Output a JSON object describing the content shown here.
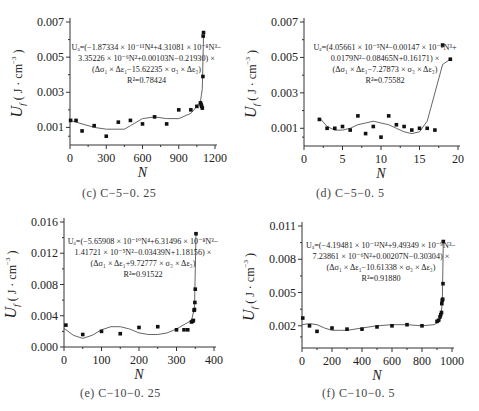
{
  "figure": {
    "y_label_main": "U",
    "y_label_sub": "f",
    "y_label_units": "( J · cm",
    "y_label_exp": "−3",
    "y_label_close": ")",
    "x_label": "N"
  },
  "panels": [
    {
      "id": "c",
      "caption": "(c) C−5−0. 25",
      "equation": [
        "Uₐ=(−1.87334 × 10⁻¹¹N⁴+4.31081 × 10⁻⁸N³−",
        "3.35226 × 10⁻⁶N²+0.00103N−0.21930) ×",
        "(Δσ₁ × Δε₁−15.62235 × σ₃ × Δε₃)",
        "R²=0.78424"
      ]
    },
    {
      "id": "d",
      "caption": "(d) C−5−0. 5",
      "equation": [
        "Uₐ=(4.05661 × 10⁻⁵N⁴−0.00147 × 10⁻⁸N³+",
        "0.0179N²−0.08465N+0.16171) ×",
        "(Δσ₁ × Δε₁−7.27873 × σ₃ × Δε₃)",
        "R²=0.75582"
      ]
    },
    {
      "id": "e",
      "caption": "(e) C−10−0. 25",
      "equation": [
        "Uₐ=(−5.65908 × 10⁻¹⁰N⁴+6.31496 × 10⁻⁸N³−",
        "1.41721 × 10⁻⁵N²−0.03439N+1.18156) ×",
        "(Δσ₁ × Δε₁+9.72777 × σ₃ × Δε₃)",
        "R²=0.91522"
      ]
    },
    {
      "id": "f",
      "caption": "(f) C−10−0. 5",
      "equation": [
        "Uₐ=(−4.19481 × 10⁻¹²N⁴+9.49349 × 10⁻⁹N³−",
        "7.23861 × 10⁻⁶N²+0.00207N−0.30304) ×",
        "(Δσ₁ × Δε₁−10.61338 × σ₃ × Δε₃)",
        "R²=0.91880"
      ]
    }
  ],
  "chart_data": [
    {
      "type": "scatter",
      "title": "(c) C-5-0.25",
      "xlabel": "N",
      "ylabel": "U_f (J·cm^-3)",
      "xlim": [
        0,
        1200
      ],
      "ylim": [
        0,
        0.007
      ],
      "xticks": [
        0,
        300,
        600,
        900,
        1200
      ],
      "yticks": [
        0.001,
        0.003,
        0.005,
        0.007
      ],
      "ytick_labels": [
        "0.001",
        "0.003",
        "0.005",
        "0.007"
      ],
      "series": [
        {
          "name": "measured",
          "x": [
            5,
            50,
            100,
            200,
            300,
            400,
            500,
            600,
            700,
            800,
            900,
            1000,
            1050,
            1080,
            1085,
            1090,
            1095,
            1100,
            1102,
            1105
          ],
          "y": [
            0.0014,
            0.0014,
            0.0008,
            0.0011,
            0.0005,
            0.0013,
            0.0014,
            0.0012,
            0.0016,
            0.0012,
            0.002,
            0.002,
            0.0022,
            0.0024,
            0.0023,
            0.0022,
            0.0021,
            0.0039,
            0.0062,
            0.0064
          ]
        },
        {
          "name": "fit",
          "x": [
            0,
            100,
            200,
            300,
            400,
            450,
            500,
            600,
            700,
            800,
            900,
            1000,
            1050,
            1080,
            1095,
            1105
          ],
          "y": [
            0.0014,
            0.0012,
            0.001,
            0.0009,
            0.0009,
            0.0009,
            0.0011,
            0.0015,
            0.0016,
            0.0015,
            0.0015,
            0.0018,
            0.0022,
            0.0025,
            0.0032,
            0.0062
          ]
        }
      ],
      "annotation": "U_f=(-1.87334×10^-11 N^4+4.31081×10^-8 N^3-3.35226×10^-6 N^2+0.00103N-0.21930)×(Δσ1×Δε1-15.62235×σ3×Δε3), R²=0.78424"
    },
    {
      "type": "scatter",
      "title": "(d) C-5-0.5",
      "xlabel": "N",
      "ylabel": "U_f (J·cm^-3)",
      "xlim": [
        0,
        20
      ],
      "ylim": [
        0,
        0.007
      ],
      "xticks": [
        0,
        5,
        10,
        15,
        20
      ],
      "yticks": [
        0.001,
        0.003,
        0.005,
        0.007
      ],
      "ytick_labels": [
        "0.001",
        "0.003",
        "0.005",
        "0.007"
      ],
      "series": [
        {
          "name": "measured",
          "x": [
            2,
            3,
            4,
            5,
            6,
            7,
            8,
            9,
            10,
            11,
            12,
            13,
            14,
            15,
            16,
            17,
            18,
            19
          ],
          "y": [
            0.0015,
            0.001,
            0.001,
            0.0011,
            0.0009,
            0.0017,
            0.0007,
            0.0011,
            0.0005,
            0.0017,
            0.0012,
            0.0011,
            0.0009,
            0.001,
            0.001,
            0.0009,
            0.0057,
            0.0049
          ]
        },
        {
          "name": "fit",
          "x": [
            2,
            3,
            4,
            5,
            6,
            7,
            8,
            9,
            10,
            11,
            12,
            13,
            14,
            15,
            16,
            17,
            18,
            19
          ],
          "y": [
            0.0016,
            0.0011,
            0.0009,
            0.0009,
            0.001,
            0.0012,
            0.0013,
            0.0014,
            0.0013,
            0.0012,
            0.001,
            0.0008,
            0.0007,
            0.0008,
            0.0014,
            0.003,
            0.0046,
            0.0049
          ]
        }
      ],
      "annotation": "U_f=(4.05661×10^-5 N^4-0.00147×10^-8 N^3+0.0179N^2-0.08465N+0.16171)×(Δσ1×Δε1-7.27873×σ3×Δε3), R²=0.75582"
    },
    {
      "type": "scatter",
      "title": "(e) C-10-0.25",
      "xlabel": "N",
      "ylabel": "U_f (J·cm^-3)",
      "xlim": [
        0,
        400
      ],
      "ylim": [
        0,
        0.016
      ],
      "xticks": [
        0,
        100,
        200,
        300,
        400
      ],
      "yticks": [
        0.0,
        0.004,
        0.008,
        0.012,
        0.016
      ],
      "ytick_labels": [
        "0.000",
        "0.004",
        "0.008",
        "0.012",
        "0.016"
      ],
      "series": [
        {
          "name": "measured",
          "x": [
            5,
            50,
            100,
            150,
            200,
            250,
            300,
            320,
            330,
            340,
            343,
            345,
            347,
            348,
            349,
            350,
            352
          ],
          "y": [
            0.0028,
            0.0016,
            0.002,
            0.0017,
            0.0025,
            0.0026,
            0.0022,
            0.0022,
            0.0022,
            0.0032,
            0.0033,
            0.0034,
            0.0047,
            0.0048,
            0.0057,
            0.0074,
            0.0145
          ]
        },
        {
          "name": "fit",
          "x": [
            0,
            25,
            50,
            75,
            100,
            125,
            150,
            175,
            200,
            225,
            250,
            275,
            300,
            325,
            340,
            348,
            352
          ],
          "y": [
            0.0024,
            0.0015,
            0.0011,
            0.0015,
            0.0022,
            0.0026,
            0.0026,
            0.0023,
            0.0018,
            0.0016,
            0.0016,
            0.0018,
            0.0023,
            0.003,
            0.0034,
            0.005,
            0.0145
          ]
        }
      ],
      "annotation": "U_f=(-5.65908×10^-10 N^4+6.31496×10^-8 N^3-1.41721×10^-5 N^2-0.03439N+1.18156)×(Δσ1×Δε1+9.72777×σ3×Δε3), R²=0.91522"
    },
    {
      "type": "scatter",
      "title": "(f) C-10-0.5",
      "xlabel": "N",
      "ylabel": "U_f (J·cm^-3)",
      "xlim": [
        0,
        1000
      ],
      "ylim": [
        0,
        0.011
      ],
      "xticks": [
        0,
        200,
        400,
        600,
        800,
        1000
      ],
      "yticks": [
        0.002,
        0.005,
        0.008,
        0.011
      ],
      "ytick_labels": [
        "0.002",
        "0.005",
        "0.008",
        "0.011"
      ],
      "series": [
        {
          "name": "measured",
          "x": [
            5,
            50,
            100,
            200,
            300,
            400,
            500,
            600,
            700,
            800,
            900,
            910,
            920,
            925,
            930,
            932,
            935,
            938,
            940,
            942
          ],
          "y": [
            0.0027,
            0.002,
            0.0015,
            0.0018,
            0.0017,
            0.0017,
            0.0019,
            0.002,
            0.0021,
            0.002,
            0.0024,
            0.0025,
            0.0028,
            0.003,
            0.0032,
            0.004,
            0.0043,
            0.0044,
            0.0058,
            0.0096
          ]
        },
        {
          "name": "fit",
          "x": [
            0,
            50,
            100,
            150,
            200,
            250,
            300,
            400,
            500,
            600,
            700,
            800,
            880,
            920,
            935,
            942
          ],
          "y": [
            0.0021,
            0.0022,
            0.0021,
            0.0018,
            0.0016,
            0.0016,
            0.0016,
            0.0018,
            0.002,
            0.0021,
            0.0021,
            0.002,
            0.0021,
            0.0024,
            0.004,
            0.0096
          ]
        }
      ],
      "annotation": "U_f=(-4.19481×10^-12 N^4+9.49349×10^-9 N^3-7.23861×10^-6 N^2+0.00207N-0.30304)×(Δσ1×Δε1-10.61338×σ3×Δε3), R²=0.91880"
    }
  ]
}
